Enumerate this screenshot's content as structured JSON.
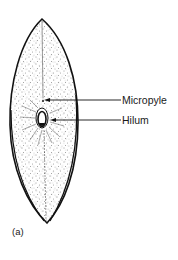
{
  "figure": {
    "panel_label": "(a)",
    "labels": [
      {
        "text": "Micropyle",
        "target": "micropyle"
      },
      {
        "text": "Hilum",
        "target": "hilum"
      }
    ],
    "colors": {
      "ink": "#1a1a1a",
      "background": "#ffffff"
    }
  }
}
